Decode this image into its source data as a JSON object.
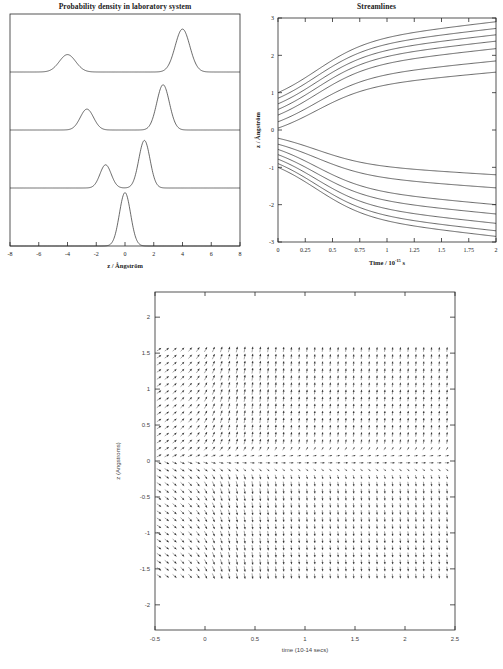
{
  "figure": {
    "panels": [
      "probability-density",
      "streamlines",
      "velocity-field"
    ]
  },
  "chart_data": [
    {
      "id": "probability-density",
      "type": "line",
      "title": "Probability density in laboratory system",
      "xlabel": "z / Ångström",
      "ylabel": "",
      "xlim": [
        -8,
        8
      ],
      "ylim": [
        0,
        4
      ],
      "xticks": [
        -8,
        -6,
        -4,
        -2,
        0,
        2,
        4,
        6,
        8
      ],
      "xticklabels": [
        "-8",
        "-6",
        "-4",
        "-2",
        "0",
        "2",
        "4",
        "6",
        "8"
      ],
      "grid": false,
      "legend": "none",
      "note": "Four stacked time snapshots of a wavepacket splitting; baselines offset upward with time.",
      "series": [
        {
          "name": "t0 (bottom, initial single packet)",
          "baseline": 0,
          "peaks": [
            {
              "center": 0.0,
              "height": 0.92,
              "width": 0.55
            }
          ]
        },
        {
          "name": "t1 (splitting begins)",
          "baseline": 1,
          "peaks": [
            {
              "center": -1.35,
              "height": 0.4,
              "width": 0.55
            },
            {
              "center": 1.35,
              "height": 0.82,
              "width": 0.55
            }
          ]
        },
        {
          "name": "t2 (packets separating)",
          "baseline": 2,
          "peaks": [
            {
              "center": -2.65,
              "height": 0.36,
              "width": 0.65
            },
            {
              "center": 2.65,
              "height": 0.78,
              "width": 0.62
            }
          ]
        },
        {
          "name": "t3 (top, fully separated)",
          "baseline": 3,
          "peaks": [
            {
              "center": -4.0,
              "height": 0.3,
              "width": 0.8
            },
            {
              "center": 4.0,
              "height": 0.74,
              "width": 0.72
            }
          ]
        }
      ]
    },
    {
      "id": "streamlines",
      "type": "line",
      "title": "Streamlines",
      "xlabel": "Time / 10",
      "xlabel_exponent": "-15",
      "xlabel_suffix": "s",
      "ylabel": "z / Ångström",
      "xlim": [
        0,
        2
      ],
      "ylim": [
        -3,
        3
      ],
      "xticks": [
        0,
        0.25,
        0.5,
        0.75,
        1,
        1.25,
        1.5,
        1.75,
        2
      ],
      "xticklabels": [
        "0",
        "0.25",
        "0.5",
        "0.75",
        "1",
        "1.25",
        "1.5",
        "1.75",
        "2"
      ],
      "yticks": [
        -3,
        -2,
        -1,
        0,
        1,
        2,
        3
      ],
      "yticklabels": [
        "-3",
        "-2",
        "-1",
        "0",
        "1",
        "2",
        "3"
      ],
      "grid": false,
      "legend": "none",
      "note": "Bohmian trajectories starting evenly spaced in z at t=0, fanning apart; upper set rises, lower set falls.",
      "start_z": [
        1.0,
        0.85,
        0.7,
        0.55,
        0.4,
        0.22,
        0.05,
        -0.22,
        -0.38,
        -0.52,
        -0.66,
        -0.78,
        -0.9,
        -1.0
      ],
      "end_z": [
        2.9,
        2.72,
        2.55,
        2.38,
        2.18,
        1.85,
        1.55,
        -1.2,
        -1.55,
        -2.0,
        -2.25,
        -2.5,
        -2.7,
        -2.85
      ],
      "turn_time": 0.35
    },
    {
      "id": "velocity-field",
      "type": "quiver",
      "title": "",
      "xlabel": "time (10-14 secs)",
      "ylabel": "z (Angstroms)",
      "xlim": [
        -0.5,
        2.5
      ],
      "ylim": [
        -2.35,
        2.35
      ],
      "xticks": [
        -0.5,
        0,
        0.5,
        1,
        1.5,
        2,
        2.5
      ],
      "xticklabels": [
        "-0.5",
        "0",
        "0.5",
        "1",
        "1.5",
        "2",
        "2.5"
      ],
      "yticks": [
        -2,
        -1.5,
        -1,
        -0.5,
        0,
        0.5,
        1,
        1.5,
        2
      ],
      "yticklabels": [
        "-2",
        "-1.5",
        "-1",
        "-0.5",
        "0",
        "0.5",
        "1",
        "1.5",
        "2"
      ],
      "grid": false,
      "legend": "none",
      "arrow_grid": {
        "nx": 38,
        "ny": 33,
        "z_min": -1.6,
        "z_max": 1.55,
        "t_min": -0.46,
        "t_max": 2.42
      },
      "note": "Velocity vector field: diagonal up-right arrows at left edge; vertical up arrows for z>0 and vertical down arrows for z<0 at later times; near-horizontal flow along z=0."
    }
  ]
}
